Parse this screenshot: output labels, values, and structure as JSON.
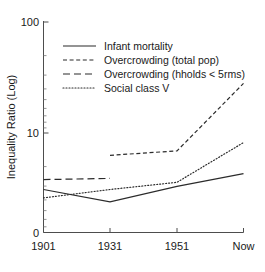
{
  "chart_data": {
    "type": "line",
    "title": "",
    "xlabel": "",
    "ylabel": "Inequality Ratio (Log)",
    "x_categories": [
      "1901",
      "1931",
      "1951",
      "Now"
    ],
    "y_scale": "log",
    "ylim": [
      1,
      100
    ],
    "y_tick_labels": [
      "0",
      "10",
      "100"
    ],
    "y_major_ticks": [
      10,
      100
    ],
    "y_minor_ticks": [
      2,
      3,
      4,
      5,
      6,
      7,
      8,
      9,
      20,
      30,
      40,
      50,
      60,
      70,
      80,
      90
    ],
    "grid": false,
    "legend_position": "top-left",
    "series": [
      {
        "name": "Infant mortality",
        "style": "solid",
        "x": [
          "1901",
          "1931",
          "1951",
          "Now"
        ],
        "values": [
          3.1,
          2.4,
          3.3,
          4.3
        ]
      },
      {
        "name": "Overcrowding (total pop)",
        "style": "short-dash",
        "x": [
          "1931",
          "1951",
          "Now"
        ],
        "values": [
          6.3,
          6.9,
          28.0
        ]
      },
      {
        "name": "Overcrowding (hholds < 5rms)",
        "style": "long-dash",
        "x": [
          "1901",
          "1931"
        ],
        "values": [
          3.8,
          3.9
        ]
      },
      {
        "name": "Social class V",
        "style": "dotted",
        "x": [
          "1901",
          "1931",
          "1951",
          "Now"
        ],
        "values": [
          2.6,
          3.1,
          3.6,
          8.2
        ]
      }
    ]
  },
  "axis": {
    "y_label": "Inequality Ratio (Log)",
    "y_tick_top": "100",
    "y_tick_mid": "10",
    "y_tick_zero": "0",
    "x_tick_1": "1901",
    "x_tick_2": "1931",
    "x_tick_3": "1951",
    "x_tick_4": "Now"
  },
  "legend": {
    "entry_1": "Infant mortality",
    "entry_2": "Overcrowding (total pop)",
    "entry_3": "Overcrowding (hholds < 5rms)",
    "entry_4": "Social class V"
  },
  "colors": {
    "ink": "#2b2b2b",
    "axis": "#4d4d4d",
    "background": "#ffffff"
  }
}
